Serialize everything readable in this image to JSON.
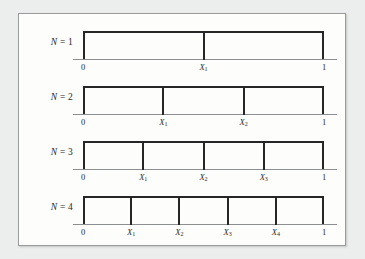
{
  "figure": {
    "background_color": "#eceded",
    "panel_color": "#fdfdfc",
    "border_color": "#9a9b9d",
    "bar_color": "#262626",
    "axis_color": "#8d8e90",
    "text_color": "#2a2a2a"
  },
  "chart_data": {
    "type": "diagram",
    "title": "",
    "xlabel": "",
    "ylabel": "",
    "xlim": [
      0,
      1
    ],
    "grid": false,
    "legend": null,
    "rows": [
      {
        "label_prefix": "N",
        "label_eq": "=",
        "label_value": "1",
        "n": 1,
        "segments": 2,
        "endpoints": [
          "0",
          "1"
        ],
        "interior_points": [
          {
            "label": "X",
            "sub": "1",
            "position": 0.5
          }
        ]
      },
      {
        "label_prefix": "N",
        "label_eq": "=",
        "label_value": "2",
        "n": 2,
        "segments": 3,
        "endpoints": [
          "0",
          "1"
        ],
        "interior_points": [
          {
            "label": "X",
            "sub": "1",
            "position": 0.3333
          },
          {
            "label": "X",
            "sub": "2",
            "position": 0.6667
          }
        ]
      },
      {
        "label_prefix": "N",
        "label_eq": "=",
        "label_value": "3",
        "n": 3,
        "segments": 4,
        "endpoints": [
          "0",
          "1"
        ],
        "interior_points": [
          {
            "label": "X",
            "sub": "1",
            "position": 0.25
          },
          {
            "label": "X",
            "sub": "2",
            "position": 0.5
          },
          {
            "label": "X",
            "sub": "3",
            "position": 0.75
          }
        ]
      },
      {
        "label_prefix": "N",
        "label_eq": "=",
        "label_value": "4",
        "n": 4,
        "segments": 5,
        "endpoints": [
          "0",
          "1"
        ],
        "interior_points": [
          {
            "label": "X",
            "sub": "1",
            "position": 0.2
          },
          {
            "label": "X",
            "sub": "2",
            "position": 0.4
          },
          {
            "label": "X",
            "sub": "3",
            "position": 0.6
          },
          {
            "label": "X",
            "sub": "4",
            "position": 0.8
          }
        ]
      }
    ]
  }
}
